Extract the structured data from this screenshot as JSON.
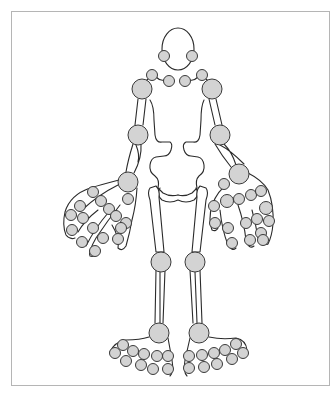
{
  "diagram": {
    "title": "",
    "colors": {
      "frame_border": "#b5b5b5",
      "outline": "#2b2b2b",
      "joint_fill": "#d3d3d3",
      "joint_stroke": "#3a3a3a",
      "background": "#ffffff"
    },
    "head": {
      "cx": 178,
      "cy": 49,
      "rx": 16,
      "ry": 21
    },
    "joints": [
      {
        "name": "tmj-left",
        "cx": 164,
        "cy": 56,
        "r": 5.5
      },
      {
        "name": "tmj-right",
        "cx": 192,
        "cy": 56,
        "r": 5.5
      },
      {
        "name": "acromioclavicular-left",
        "cx": 152,
        "cy": 75,
        "r": 5.5
      },
      {
        "name": "sternoclavicular-left",
        "cx": 169,
        "cy": 81,
        "r": 5.5
      },
      {
        "name": "sternoclavicular-right",
        "cx": 185,
        "cy": 81,
        "r": 5.5
      },
      {
        "name": "acromioclavicular-right",
        "cx": 202,
        "cy": 75,
        "r": 5.5
      },
      {
        "name": "shoulder-left",
        "cx": 142,
        "cy": 89,
        "r": 10
      },
      {
        "name": "shoulder-right",
        "cx": 212,
        "cy": 89,
        "r": 10
      },
      {
        "name": "elbow-left",
        "cx": 138,
        "cy": 135,
        "r": 10
      },
      {
        "name": "elbow-right",
        "cx": 220,
        "cy": 135,
        "r": 10
      },
      {
        "name": "wrist-left",
        "cx": 128,
        "cy": 182,
        "r": 10
      },
      {
        "name": "wrist-right",
        "cx": 239,
        "cy": 174,
        "r": 10
      },
      {
        "name": "hand-left-1",
        "cx": 128,
        "cy": 199,
        "r": 5.5
      },
      {
        "name": "hand-left-2",
        "cx": 93,
        "cy": 192,
        "r": 5.5
      },
      {
        "name": "hand-left-3",
        "cx": 101,
        "cy": 201,
        "r": 5.5
      },
      {
        "name": "hand-left-4",
        "cx": 80,
        "cy": 206,
        "r": 5.5
      },
      {
        "name": "hand-left-5",
        "cx": 109,
        "cy": 209,
        "r": 5.5
      },
      {
        "name": "hand-left-6",
        "cx": 116,
        "cy": 216,
        "r": 5.5
      },
      {
        "name": "hand-left-7",
        "cx": 71,
        "cy": 215,
        "r": 5.5
      },
      {
        "name": "hand-left-8",
        "cx": 83,
        "cy": 218,
        "r": 5.5
      },
      {
        "name": "hand-left-9",
        "cx": 93,
        "cy": 228,
        "r": 5.5
      },
      {
        "name": "hand-left-10",
        "cx": 126,
        "cy": 223,
        "r": 5.5
      },
      {
        "name": "hand-left-11",
        "cx": 72,
        "cy": 230,
        "r": 5.5
      },
      {
        "name": "hand-left-12",
        "cx": 103,
        "cy": 238,
        "r": 5.5
      },
      {
        "name": "hand-left-13",
        "cx": 82,
        "cy": 242,
        "r": 5.5
      },
      {
        "name": "hand-left-14",
        "cx": 118,
        "cy": 239,
        "r": 5.5
      },
      {
        "name": "hand-left-15",
        "cx": 95,
        "cy": 251,
        "r": 5.5
      },
      {
        "name": "hand-left-16",
        "cx": 121,
        "cy": 228,
        "r": 5.5
      },
      {
        "name": "hand-right-1",
        "cx": 224,
        "cy": 184,
        "r": 5.5
      },
      {
        "name": "hand-right-2",
        "cx": 227,
        "cy": 201,
        "r": 6.5
      },
      {
        "name": "hand-right-3",
        "cx": 214,
        "cy": 206,
        "r": 5.5
      },
      {
        "name": "hand-right-4",
        "cx": 239,
        "cy": 199,
        "r": 5.5
      },
      {
        "name": "hand-right-5",
        "cx": 251,
        "cy": 195,
        "r": 5.5
      },
      {
        "name": "hand-right-6",
        "cx": 261,
        "cy": 191,
        "r": 5.5
      },
      {
        "name": "hand-right-7",
        "cx": 266,
        "cy": 208,
        "r": 6.5
      },
      {
        "name": "hand-right-8",
        "cx": 215,
        "cy": 223,
        "r": 5.5
      },
      {
        "name": "hand-right-9",
        "cx": 228,
        "cy": 228,
        "r": 5.5
      },
      {
        "name": "hand-right-10",
        "cx": 246,
        "cy": 223,
        "r": 5.5
      },
      {
        "name": "hand-right-11",
        "cx": 257,
        "cy": 219,
        "r": 5.5
      },
      {
        "name": "hand-right-12",
        "cx": 269,
        "cy": 221,
        "r": 5.5
      },
      {
        "name": "hand-right-13",
        "cx": 261,
        "cy": 233,
        "r": 5.5
      },
      {
        "name": "hand-right-14",
        "cx": 232,
        "cy": 243,
        "r": 5.5
      },
      {
        "name": "hand-right-15",
        "cx": 250,
        "cy": 240,
        "r": 5.5
      },
      {
        "name": "hand-right-16",
        "cx": 263,
        "cy": 240,
        "r": 5.5
      },
      {
        "name": "knee-left",
        "cx": 161,
        "cy": 262,
        "r": 10
      },
      {
        "name": "knee-right",
        "cx": 195,
        "cy": 262,
        "r": 10
      },
      {
        "name": "ankle-left",
        "cx": 159,
        "cy": 333,
        "r": 10
      },
      {
        "name": "ankle-right",
        "cx": 199,
        "cy": 333,
        "r": 10
      },
      {
        "name": "foot-left-1",
        "cx": 123,
        "cy": 345,
        "r": 5.5
      },
      {
        "name": "foot-left-2",
        "cx": 115,
        "cy": 353,
        "r": 5.5
      },
      {
        "name": "foot-left-3",
        "cx": 133,
        "cy": 351,
        "r": 5.5
      },
      {
        "name": "foot-left-4",
        "cx": 126,
        "cy": 361,
        "r": 5.5
      },
      {
        "name": "foot-left-5",
        "cx": 144,
        "cy": 354,
        "r": 5.5
      },
      {
        "name": "foot-left-6",
        "cx": 141,
        "cy": 365,
        "r": 5.5
      },
      {
        "name": "foot-left-7",
        "cx": 157,
        "cy": 356,
        "r": 5.5
      },
      {
        "name": "foot-left-8",
        "cx": 153,
        "cy": 369,
        "r": 5.5
      },
      {
        "name": "foot-left-9",
        "cx": 168,
        "cy": 356,
        "r": 5.5
      },
      {
        "name": "foot-left-10",
        "cx": 168,
        "cy": 369,
        "r": 5.5
      },
      {
        "name": "foot-right-1",
        "cx": 189,
        "cy": 356,
        "r": 5.5
      },
      {
        "name": "foot-right-2",
        "cx": 189,
        "cy": 368,
        "r": 5.5
      },
      {
        "name": "foot-right-3",
        "cx": 202,
        "cy": 355,
        "r": 5.5
      },
      {
        "name": "foot-right-4",
        "cx": 204,
        "cy": 367,
        "r": 5.5
      },
      {
        "name": "foot-right-5",
        "cx": 214,
        "cy": 353,
        "r": 5.5
      },
      {
        "name": "foot-right-6",
        "cx": 217,
        "cy": 364,
        "r": 5.5
      },
      {
        "name": "foot-right-7",
        "cx": 225,
        "cy": 350,
        "r": 5.5
      },
      {
        "name": "foot-right-8",
        "cx": 232,
        "cy": 359,
        "r": 5.5
      },
      {
        "name": "foot-right-9",
        "cx": 236,
        "cy": 344,
        "r": 5.5
      },
      {
        "name": "foot-right-10",
        "cx": 243,
        "cy": 353,
        "r": 5.5
      }
    ]
  }
}
